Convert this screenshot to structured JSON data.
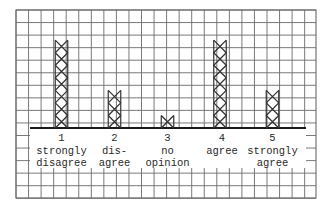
{
  "chart_data": {
    "type": "bar",
    "style": "tally-x-marks-on-grid-paper",
    "title": "",
    "xlabel": "",
    "ylabel": "",
    "categories": [
      {
        "number": "1",
        "line1": "strongly",
        "line2": "disagree"
      },
      {
        "number": "2",
        "line1": "dis-",
        "line2": "agree"
      },
      {
        "number": "3",
        "line1": "no",
        "line2": "opinion"
      },
      {
        "number": "4",
        "line1": "agree",
        "line2": ""
      },
      {
        "number": "5",
        "line1": "strongly",
        "line2": "agree"
      }
    ],
    "values": [
      7,
      3,
      1,
      7,
      3
    ],
    "ylim": [
      0,
      9
    ],
    "grid": true,
    "legend": null
  },
  "colors": {
    "grid": "#6b6b6b",
    "marks": "#333333",
    "baseline": "#1a1a1a",
    "background": "#ffffff"
  }
}
